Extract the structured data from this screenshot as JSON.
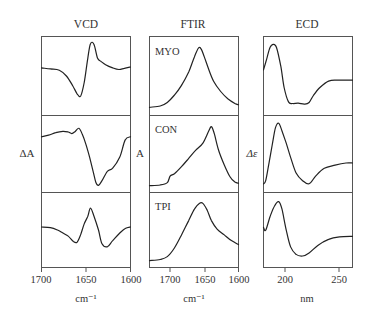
{
  "figure": {
    "columns": [
      {
        "title": "VCD",
        "ylabel": "ΔA",
        "xlabel": "cm⁻¹",
        "xticks": [
          "1700",
          "1650",
          "1600"
        ],
        "panels": [
          {
            "label": ""
          },
          {
            "label": ""
          },
          {
            "label": ""
          }
        ]
      },
      {
        "title": "FTIR",
        "ylabel": "A",
        "xlabel": "cm⁻¹",
        "xticks": [
          "1700",
          "1650",
          "1600"
        ],
        "panels": [
          {
            "label": "MYO"
          },
          {
            "label": "CON"
          },
          {
            "label": "TPI"
          }
        ]
      },
      {
        "title": "ECD",
        "ylabel": "Δε",
        "xlabel": "nm",
        "xticks": [
          "200",
          "250"
        ],
        "panels": [
          {
            "label": ""
          },
          {
            "label": ""
          },
          {
            "label": ""
          }
        ]
      }
    ]
  },
  "chart_data": [
    {
      "type": "line",
      "title": "VCD",
      "xlabel": "cm⁻¹",
      "ylabel": "ΔA",
      "xlim": [
        1700,
        1600
      ],
      "xticks": [
        1700,
        1650,
        1600
      ],
      "grid": false,
      "series": [
        {
          "name": "MYO",
          "x": [
            1700,
            1690,
            1680,
            1672,
            1665,
            1660,
            1656,
            1652,
            1648,
            1645,
            1641,
            1637,
            1633,
            1628,
            1620,
            1613,
            1607,
            1600
          ],
          "y": [
            0.25,
            0.22,
            0.18,
            0.0,
            -0.3,
            -0.55,
            -0.62,
            -0.2,
            0.55,
            1.0,
            0.98,
            0.55,
            0.45,
            0.35,
            0.25,
            0.2,
            0.24,
            0.28
          ]
        },
        {
          "name": "CON",
          "x": [
            1700,
            1692,
            1684,
            1676,
            1670,
            1666,
            1662,
            1658,
            1654,
            1650,
            1646,
            1642,
            1639,
            1636,
            1632,
            1626,
            1620,
            1612,
            1606,
            1600
          ],
          "y": [
            0.55,
            0.6,
            0.68,
            0.72,
            0.7,
            0.65,
            0.72,
            0.82,
            0.62,
            0.3,
            -0.1,
            -0.55,
            -0.9,
            -1.0,
            -0.85,
            -0.55,
            -0.45,
            -0.1,
            0.45,
            0.55
          ]
        },
        {
          "name": "TPI",
          "x": [
            1700,
            1690,
            1682,
            1676,
            1670,
            1664,
            1660,
            1656,
            1652,
            1648,
            1645,
            1641,
            1636,
            1632,
            1626,
            1620,
            1612,
            1606,
            1600
          ],
          "y": [
            0.1,
            0.08,
            0.0,
            -0.1,
            -0.2,
            -0.38,
            -0.4,
            -0.15,
            0.2,
            0.45,
            0.72,
            0.45,
            0.0,
            -0.45,
            -0.55,
            -0.35,
            -0.1,
            0.05,
            0.1
          ]
        }
      ]
    },
    {
      "type": "line",
      "title": "FTIR",
      "xlabel": "cm⁻¹",
      "ylabel": "A",
      "xlim": [
        1725,
        1600
      ],
      "xticks": [
        1700,
        1650,
        1600
      ],
      "grid": false,
      "series": [
        {
          "name": "MYO",
          "x": [
            1725,
            1710,
            1700,
            1690,
            1680,
            1670,
            1662,
            1656,
            1652,
            1648,
            1642,
            1635,
            1625,
            1615,
            1605,
            1600
          ],
          "y": [
            0.02,
            0.04,
            0.1,
            0.22,
            0.38,
            0.6,
            0.85,
            1.0,
            0.97,
            0.85,
            0.65,
            0.45,
            0.28,
            0.16,
            0.08,
            0.06
          ]
        },
        {
          "name": "CON",
          "x": [
            1725,
            1710,
            1700,
            1696,
            1690,
            1680,
            1670,
            1660,
            1650,
            1642,
            1638,
            1634,
            1628,
            1620,
            1612,
            1605,
            1600
          ],
          "y": [
            0.0,
            0.01,
            0.05,
            0.16,
            0.2,
            0.32,
            0.46,
            0.6,
            0.72,
            0.92,
            1.0,
            0.88,
            0.6,
            0.35,
            0.15,
            0.06,
            0.04
          ]
        },
        {
          "name": "TPI",
          "x": [
            1725,
            1710,
            1700,
            1690,
            1680,
            1670,
            1662,
            1655,
            1650,
            1644,
            1638,
            1630,
            1620,
            1610,
            1600
          ],
          "y": [
            0.0,
            0.02,
            0.07,
            0.22,
            0.45,
            0.7,
            0.9,
            1.0,
            1.0,
            0.88,
            0.7,
            0.55,
            0.45,
            0.35,
            0.28
          ]
        }
      ]
    },
    {
      "type": "line",
      "title": "ECD",
      "xlabel": "nm",
      "ylabel": "Δε",
      "xlim": [
        180,
        262
      ],
      "xticks": [
        200,
        250
      ],
      "grid": false,
      "series": [
        {
          "name": "MYO",
          "x": [
            180,
            183,
            186,
            189,
            192,
            196,
            199,
            203,
            207,
            212,
            218,
            222,
            226,
            232,
            240,
            248,
            262
          ],
          "y": [
            0.2,
            0.55,
            0.9,
            1.0,
            0.9,
            0.3,
            -0.35,
            -0.8,
            -0.85,
            -0.84,
            -0.87,
            -0.82,
            -0.6,
            -0.35,
            -0.15,
            -0.12,
            -0.12
          ]
        },
        {
          "name": "CON",
          "x": [
            180,
            182,
            185,
            188,
            191,
            194,
            197,
            201,
            205,
            210,
            216,
            222,
            228,
            236,
            246,
            256,
            262
          ],
          "y": [
            -0.95,
            -0.85,
            -0.3,
            0.3,
            0.85,
            1.0,
            0.75,
            0.35,
            -0.1,
            -0.6,
            -0.85,
            -0.95,
            -0.7,
            -0.45,
            -0.35,
            -0.28,
            -0.28
          ]
        },
        {
          "name": "TPI",
          "x": [
            180,
            182,
            186,
            190,
            194,
            197,
            201,
            205,
            210,
            216,
            222,
            230,
            240,
            250,
            262
          ],
          "y": [
            0.1,
            0.0,
            0.45,
            0.8,
            0.95,
            0.7,
            0.0,
            -0.55,
            -0.8,
            -0.85,
            -0.75,
            -0.5,
            -0.3,
            -0.22,
            -0.2
          ]
        }
      ]
    }
  ]
}
